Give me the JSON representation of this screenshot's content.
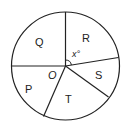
{
  "diagram": {
    "type": "circle-sectors",
    "stroke_color": "#222222",
    "background": "#ffffff",
    "center_label": "O",
    "angle_label": "x°",
    "sectors": [
      {
        "label": "Q"
      },
      {
        "label": "R"
      },
      {
        "label": "S"
      },
      {
        "label": "T"
      },
      {
        "label": "P"
      }
    ]
  }
}
